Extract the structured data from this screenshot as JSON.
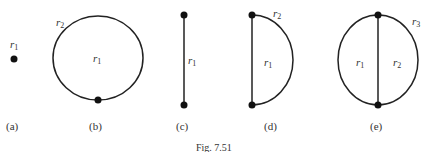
{
  "figure": {
    "caption": "Fig. 7.51",
    "panels": [
      {
        "id": "a",
        "label": "(a)",
        "regions": [
          {
            "name": "r",
            "sub": "1"
          }
        ]
      },
      {
        "id": "b",
        "label": "(b)",
        "regions": [
          {
            "name": "r",
            "sub": "1"
          },
          {
            "name": "r",
            "sub": "2"
          }
        ]
      },
      {
        "id": "c",
        "label": "(c)",
        "regions": [
          {
            "name": "r",
            "sub": "1"
          }
        ]
      },
      {
        "id": "d",
        "label": "(d)",
        "regions": [
          {
            "name": "r",
            "sub": "1"
          },
          {
            "name": "r",
            "sub": "2"
          }
        ]
      },
      {
        "id": "e",
        "label": "(e)",
        "regions": [
          {
            "name": "r",
            "sub": "1"
          },
          {
            "name": "r",
            "sub": "2"
          },
          {
            "name": "r",
            "sub": "3"
          }
        ]
      }
    ]
  }
}
